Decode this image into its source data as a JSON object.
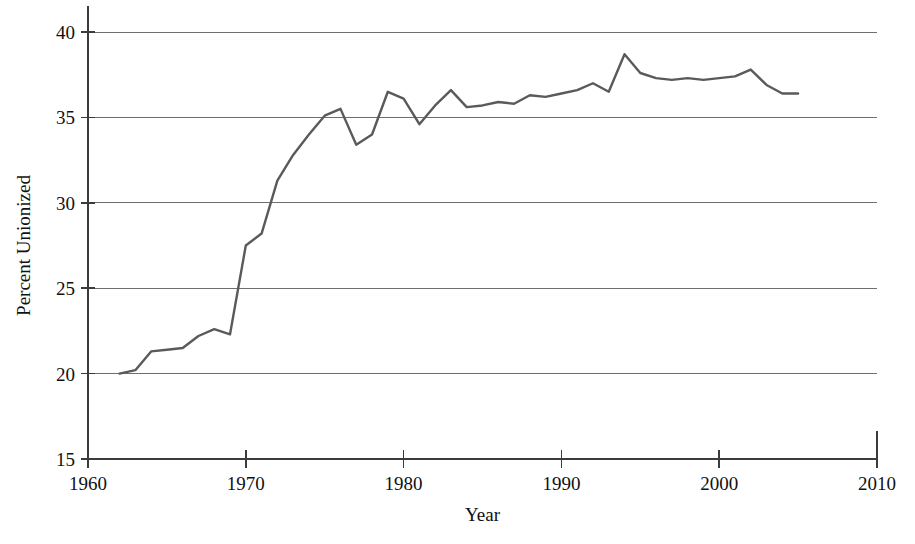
{
  "chart_data": {
    "type": "line",
    "title": "",
    "xlabel": "Year",
    "ylabel": "Percent Unionized",
    "xlim": [
      1960,
      2010
    ],
    "ylim": [
      15,
      40
    ],
    "xticks": [
      1960,
      1970,
      1980,
      1990,
      2000,
      2010
    ],
    "yticks": [
      15,
      20,
      25,
      30,
      35,
      40
    ],
    "grid": true,
    "legend": null,
    "line_color": "#5a5a5a",
    "axis_color": "#3c3c3c",
    "grid_color": "#6e6e6e",
    "x": [
      1962,
      1963,
      1964,
      1965,
      1966,
      1967,
      1968,
      1969,
      1970,
      1971,
      1972,
      1973,
      1974,
      1975,
      1976,
      1977,
      1978,
      1979,
      1980,
      1981,
      1982,
      1983,
      1984,
      1985,
      1986,
      1987,
      1988,
      1989,
      1990,
      1991,
      1992,
      1993,
      1994,
      1995,
      1996,
      1997,
      1998,
      1999,
      2000,
      2001,
      2002,
      2003,
      2004,
      2005
    ],
    "values": [
      20.0,
      20.2,
      21.3,
      21.4,
      21.5,
      22.2,
      22.6,
      22.3,
      27.5,
      28.2,
      31.3,
      32.8,
      34.0,
      35.1,
      35.5,
      33.4,
      34.0,
      36.5,
      36.1,
      34.6,
      35.7,
      36.6,
      35.6,
      35.7,
      35.9,
      35.8,
      36.3,
      36.2,
      36.4,
      36.6,
      37.0,
      36.5,
      38.7,
      37.6,
      37.3,
      37.2,
      37.3,
      37.2,
      37.3,
      37.4,
      37.8,
      36.9,
      36.4,
      36.4
    ],
    "series": [
      {
        "name": "Percent Unionized",
        "values": [
          20.0,
          20.2,
          21.3,
          21.4,
          21.5,
          22.2,
          22.6,
          22.3,
          27.5,
          28.2,
          31.3,
          32.8,
          34.0,
          35.1,
          35.5,
          33.4,
          34.0,
          36.5,
          36.1,
          34.6,
          35.7,
          36.6,
          35.6,
          35.7,
          35.9,
          35.8,
          36.3,
          36.2,
          36.4,
          36.6,
          37.0,
          36.5,
          38.7,
          37.6,
          37.3,
          37.2,
          37.3,
          37.2,
          37.3,
          37.4,
          37.8,
          36.9,
          36.4,
          36.4
        ]
      }
    ]
  }
}
